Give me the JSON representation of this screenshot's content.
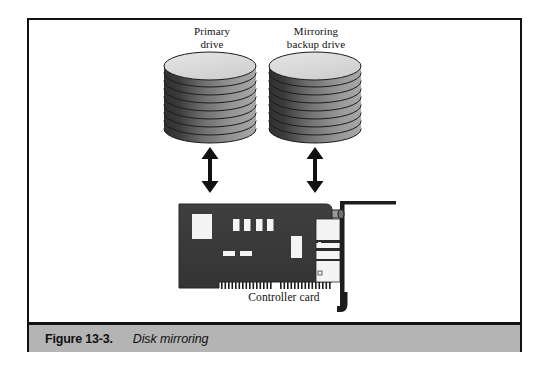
{
  "figure": {
    "caption_number": "Figure 13-3.",
    "caption_title": "Disk mirroring",
    "frame_border_color": "#111111",
    "caption_bar_color": "#b4b4b4",
    "background_color": "#ffffff"
  },
  "labels": {
    "primary_drive": "Primary\ndrive",
    "primary_drive_line1": "Primary",
    "primary_drive_line2": "drive",
    "mirror_drive_line1": "Mirroring",
    "mirror_drive_line2": "backup drive",
    "controller_card": "Controller card"
  },
  "diagram": {
    "type": "schematic",
    "nodes": [
      {
        "id": "primary-drive",
        "name": "Primary drive",
        "kind": "disk-stack",
        "platter_count": 8,
        "top_color": "#d8d8d8",
        "side_color_dark": "#3a3a3a",
        "side_color_light": "#a8a8a8"
      },
      {
        "id": "mirroring-backup-drive",
        "name": "Mirroring backup drive",
        "kind": "disk-stack",
        "platter_count": 8,
        "top_color": "#d8d8d8",
        "side_color_dark": "#3a3a3a",
        "side_color_light": "#a8a8a8"
      },
      {
        "id": "controller-card",
        "name": "Controller card",
        "kind": "expansion-card",
        "board_color": "#3c3c3c",
        "component_color": "#f2f2f2",
        "components": [
          {
            "id": "large-chip",
            "kind": "chip"
          },
          {
            "id": "small-chip-1",
            "kind": "chip"
          },
          {
            "id": "small-chip-2",
            "kind": "chip"
          },
          {
            "id": "small-chip-3",
            "kind": "chip"
          },
          {
            "id": "small-chip-4",
            "kind": "chip"
          },
          {
            "id": "tall-chip",
            "kind": "chip"
          },
          {
            "id": "resistor-1",
            "kind": "resistor"
          },
          {
            "id": "resistor-2",
            "kind": "resistor"
          },
          {
            "id": "edge-connector",
            "kind": "gold-fingers"
          },
          {
            "id": "port-block",
            "kind": "io-connector"
          },
          {
            "id": "mounting-bracket",
            "kind": "bracket"
          },
          {
            "id": "thumbscrew",
            "kind": "thumbscrew"
          }
        ]
      }
    ],
    "connections": [
      {
        "id": "link-primary",
        "from": "controller-card",
        "to": "primary-drive",
        "style": "double-headed-arrow",
        "direction": "bidirectional"
      },
      {
        "id": "link-mirror",
        "from": "controller-card",
        "to": "mirroring-backup-drive",
        "style": "double-headed-arrow",
        "direction": "bidirectional"
      }
    ]
  }
}
